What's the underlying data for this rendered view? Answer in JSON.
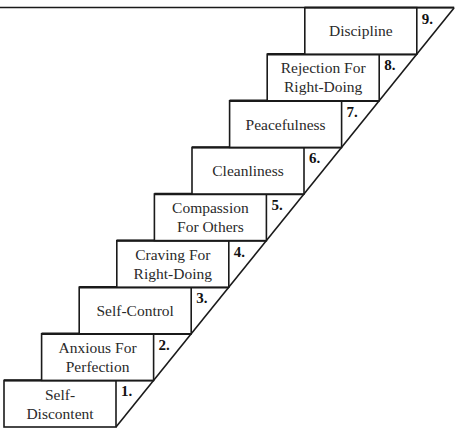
{
  "diagram": {
    "type": "staircase",
    "line_color": "#1a1a1a",
    "background": "#ffffff",
    "steps": [
      {
        "number": "1.",
        "label": "Self-\nDiscontent"
      },
      {
        "number": "2.",
        "label": "Anxious For\nPerfection"
      },
      {
        "number": "3.",
        "label": "Self-Control"
      },
      {
        "number": "4.",
        "label": "Craving For\nRight-Doing"
      },
      {
        "number": "5.",
        "label": "Compassion\nFor Others"
      },
      {
        "number": "6.",
        "label": "Cleanliness"
      },
      {
        "number": "7.",
        "label": "Peacefulness"
      },
      {
        "number": "8.",
        "label": "Rejection For\nRight-Doing"
      },
      {
        "number": "9.",
        "label": "Discipline"
      }
    ]
  }
}
